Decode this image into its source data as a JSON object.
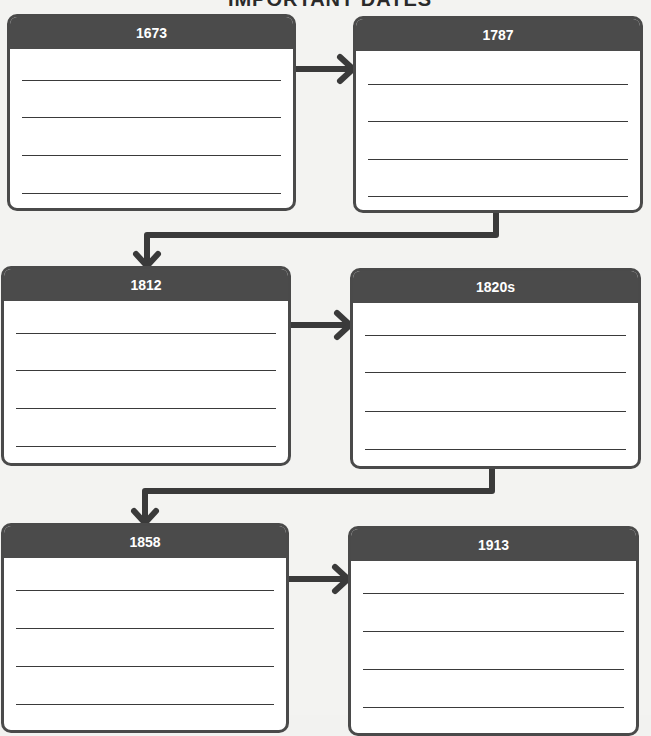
{
  "title_partial": "IMPORTANT DATES",
  "colors": {
    "header": "#4b4b4b",
    "border": "#4a4a4a",
    "arrow": "#3a3a3a",
    "background": "#f3f3f1"
  },
  "boxes": [
    {
      "label": "1673",
      "lines": 4
    },
    {
      "label": "1787",
      "lines": 4
    },
    {
      "label": "1812",
      "lines": 4
    },
    {
      "label": "1820s",
      "lines": 4
    },
    {
      "label": "1858",
      "lines": 4
    },
    {
      "label": "1913",
      "lines": 4
    }
  ],
  "flow": [
    {
      "from": "1673",
      "to": "1787",
      "direction": "right"
    },
    {
      "from": "1787",
      "to": "1812",
      "direction": "elbow-down-left"
    },
    {
      "from": "1812",
      "to": "1820s",
      "direction": "right"
    },
    {
      "from": "1820s",
      "to": "1858",
      "direction": "elbow-down-left"
    },
    {
      "from": "1858",
      "to": "1913",
      "direction": "right"
    }
  ]
}
